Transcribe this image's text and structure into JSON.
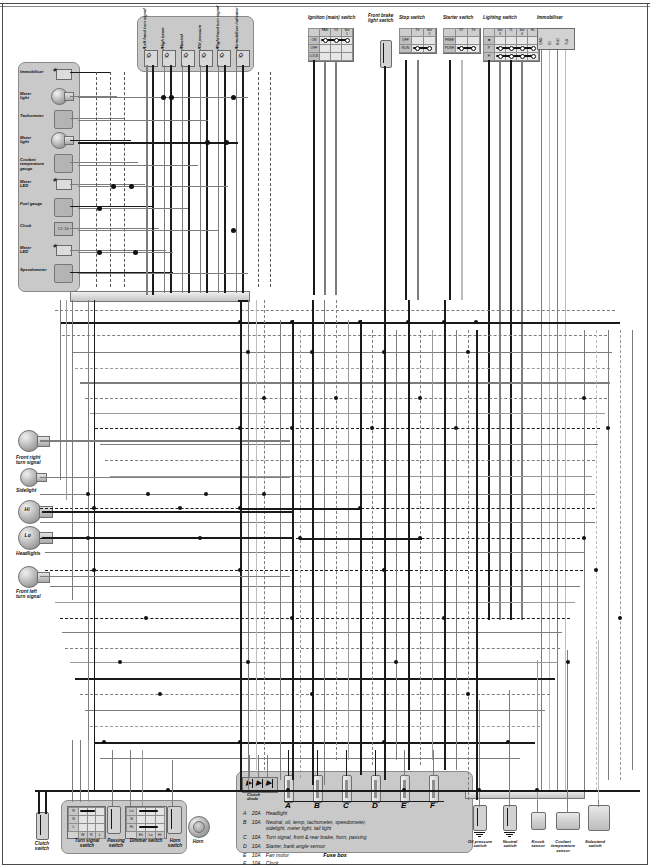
{
  "diagram": {
    "type": "automotive-wiring-schematic",
    "width": 650,
    "height": 868
  },
  "instrument_cluster": {
    "name": "instrument-cluster",
    "items": [
      {
        "label": "Immobiliser",
        "kind": "led"
      },
      {
        "label": "Meter\nlight",
        "kind": "bulb"
      },
      {
        "label": "Tachometer",
        "kind": "gauge"
      },
      {
        "label": "Meter\nlight",
        "kind": "bulb"
      },
      {
        "label": "Coolant\ntemperature\ngauge",
        "kind": "gauge"
      },
      {
        "label": "Meter\nLED",
        "kind": "led"
      },
      {
        "label": "Fuel gauge",
        "kind": "gauge"
      },
      {
        "label": "Clock",
        "kind": "lcd",
        "display": "12:30"
      },
      {
        "label": "Meter\nLED",
        "kind": "led"
      },
      {
        "label": "Speedometer",
        "kind": "gauge"
      }
    ]
  },
  "warning_panel": {
    "name": "warning-indicator-panel",
    "indicators": [
      {
        "label": "Left hand\nturn signal"
      },
      {
        "label": "High beam"
      },
      {
        "label": "Neutral"
      },
      {
        "label": "Oil\npressure"
      },
      {
        "label": "Right hand\nturn signal"
      },
      {
        "label": "Immobiliser\nindicator"
      }
    ]
  },
  "switches": {
    "ignition": {
      "title": "Ignition (main) switch",
      "columns": [
        "",
        "FAN",
        "IG",
        "bat\n1"
      ],
      "rows": [
        "ON",
        "OFF",
        "LOCK"
      ],
      "closed_row": "ON"
    },
    "front_brake": {
      "title": "Front brake\nlight switch"
    },
    "stop": {
      "title": "Stop switch",
      "columns": [
        "",
        "IG",
        "bat\n2"
      ],
      "rows": [
        "OFF",
        "RUN"
      ],
      "closed_row": "RUN"
    },
    "starter": {
      "title": "Starter switch",
      "columns": [
        "",
        "ST",
        "IG"
      ],
      "rows": [
        "FREE",
        "PUSH"
      ],
      "closed_row": "PUSH"
    },
    "lighting": {
      "title": "Lighting switch",
      "columns": [
        "",
        "bat\n3",
        "TL",
        "bat\n4",
        "HL"
      ],
      "rows": [
        "■",
        "P",
        "H"
      ],
      "closed_rows": [
        "P",
        "H"
      ]
    },
    "immobiliser": {
      "title": "Immobiliser",
      "pins": [
        "GND",
        "IG",
        "RxD",
        "TxD"
      ]
    },
    "turn_signal": {
      "title": "Turn signal\nswitch",
      "rows": [
        "R",
        "N",
        "L"
      ],
      "columns": [
        "W",
        "R",
        "L"
      ]
    },
    "passing": {
      "title": "Passing\nswitch"
    },
    "dimmer": {
      "title": "Dimmer switch",
      "rows": [
        "Lo",
        "N",
        "Hi"
      ],
      "columns": [
        "HL",
        "Lo",
        "Hi"
      ]
    },
    "horn_switch": {
      "title": "Horn\nswitch"
    },
    "clutch": {
      "title": "Clutch\nswitch"
    }
  },
  "lamps": {
    "front_right_turn": "Front right\nturn signal",
    "sidelight": "Sidelight",
    "headlight_hi": "Hi",
    "headlight_lo": "Lo",
    "headlights": "Headlights",
    "front_left_turn": "Front left\nturn signal",
    "horn": "Horn"
  },
  "fusebox": {
    "title": "Fuse box",
    "clutch_diode": "Clutch\ndiode",
    "letters": [
      "A",
      "B",
      "C",
      "D",
      "E",
      "F"
    ],
    "legend": [
      {
        "id": "A",
        "rating": "20A",
        "circuits": "Headlight"
      },
      {
        "id": "B",
        "rating": "10A",
        "circuits": "Neutral, oil, temp, tachometer, speedometer,\nsidelight, meter light, tail light"
      },
      {
        "id": "C",
        "rating": "10A",
        "circuits": "Turn signal, front & rear brake, horn, passing"
      },
      {
        "id": "D",
        "rating": "10A",
        "circuits": "Starter, bank angle sensor"
      },
      {
        "id": "E",
        "rating": "10A",
        "circuits": "Fan motor"
      },
      {
        "id": "F",
        "rating": "10A",
        "circuits": "Clock"
      }
    ]
  },
  "sensors": [
    {
      "label": "Oil pressure\nswitch",
      "kind": "switch-ground"
    },
    {
      "label": "Neutral\nswitch",
      "kind": "switch-ground"
    },
    {
      "label": "Knock\nsensor",
      "kind": "block"
    },
    {
      "label": "Coolant\ntemperature\nsensor",
      "kind": "block"
    },
    {
      "label": "Sidestand\nswitch",
      "kind": "block"
    }
  ],
  "colors": {
    "wire_dark": "#1a1a1a",
    "wire_mid": "#7d7d7d",
    "wire_light": "#bdbdbd",
    "panel_fill": "#c9c9c9",
    "module_fill": "#b4b4b4"
  }
}
